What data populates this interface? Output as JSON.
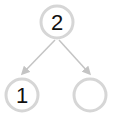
{
  "diagram": {
    "type": "number-bond",
    "colors": {
      "circle_stroke": "#d6d6d6",
      "arrow": "#c4c4c4",
      "text": "#111111"
    },
    "nodes": [
      {
        "id": "whole",
        "label": "2",
        "cx": 57,
        "cy": 22,
        "r": 16
      },
      {
        "id": "part-left",
        "label": "1",
        "cx": 22,
        "cy": 95,
        "r": 16
      },
      {
        "id": "part-right",
        "label": "",
        "cx": 90,
        "cy": 95,
        "r": 16
      }
    ],
    "edges": [
      {
        "from": "whole",
        "to": "part-left"
      },
      {
        "from": "whole",
        "to": "part-right"
      }
    ]
  }
}
